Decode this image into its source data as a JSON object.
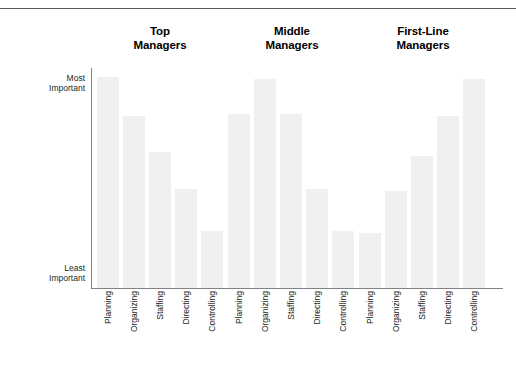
{
  "figure": {
    "rule_color": "#58595b",
    "bar_color": "#f0f0f0",
    "axis_color": "#808285"
  },
  "axis": {
    "y_top_line1": "Most",
    "y_top_line2": "Important",
    "y_bottom_line1": "Least",
    "y_bottom_line2": "Important"
  },
  "groups": [
    {
      "line1": "Top",
      "line2": "Managers"
    },
    {
      "line1": "Middle",
      "line2": "Managers"
    },
    {
      "line1": "First-Line",
      "line2": "Managers"
    }
  ],
  "chart_data": {
    "type": "bar",
    "title": "",
    "xlabel": "",
    "ylabel": "",
    "grid": false,
    "legend": "none",
    "ytick_labels": [
      "Least Important",
      "Most Important"
    ],
    "ylim": [
      0,
      100
    ],
    "categories": [
      "Planning",
      "Organizing",
      "Staffing",
      "Directing",
      "Controlling"
    ],
    "groups": [
      "Top Managers",
      "Middle Managers",
      "First-Line Managers"
    ],
    "series": [
      {
        "name": "Top Managers",
        "values": [
          96,
          78,
          62,
          45,
          26
        ]
      },
      {
        "name": "Middle Managers",
        "values": [
          79,
          95,
          79,
          45,
          26
        ]
      },
      {
        "name": "First-Line Managers",
        "values": [
          25,
          44,
          60,
          78,
          95
        ]
      }
    ]
  }
}
